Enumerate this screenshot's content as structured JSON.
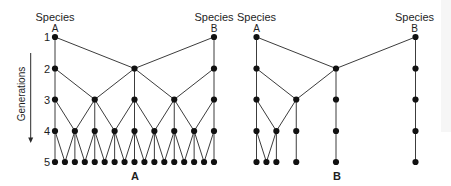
{
  "figure": {
    "generation_axis": {
      "label": "Generations",
      "ticks": [
        "1",
        "2",
        "3",
        "4",
        "5"
      ],
      "direction": "downward"
    },
    "diagrams": [
      {
        "caption": "A",
        "species": [
          {
            "name": "Species",
            "letter": "A",
            "col": 0
          },
          {
            "name": "Species",
            "letter": "B",
            "col": 16
          }
        ],
        "generations": [
          [
            0,
            16
          ],
          [
            0,
            8,
            16
          ],
          [
            0,
            4,
            8,
            12,
            16
          ],
          [
            0,
            2,
            4,
            6,
            8,
            10,
            12,
            14,
            16
          ],
          [
            0,
            1,
            2,
            3,
            4,
            5,
            6,
            7,
            8,
            9,
            10,
            11,
            12,
            13,
            14,
            15,
            16
          ]
        ],
        "edges": [
          [
            [
              0,
              0
            ],
            [
              0,
              8
            ],
            [
              16,
              8
            ],
            [
              16,
              16
            ]
          ],
          [
            [
              0,
              0
            ],
            [
              0,
              4
            ],
            [
              8,
              4
            ],
            [
              8,
              8
            ],
            [
              8,
              12
            ],
            [
              16,
              12
            ],
            [
              16,
              16
            ]
          ],
          [
            [
              0,
              0
            ],
            [
              0,
              2
            ],
            [
              4,
              2
            ],
            [
              4,
              4
            ],
            [
              4,
              6
            ],
            [
              8,
              6
            ],
            [
              8,
              8
            ],
            [
              8,
              10
            ],
            [
              12,
              10
            ],
            [
              12,
              12
            ],
            [
              12,
              14
            ],
            [
              16,
              14
            ],
            [
              16,
              16
            ]
          ],
          [
            [
              0,
              0
            ],
            [
              0,
              1
            ],
            [
              2,
              1
            ],
            [
              2,
              2
            ],
            [
              2,
              3
            ],
            [
              4,
              3
            ],
            [
              4,
              4
            ],
            [
              4,
              5
            ],
            [
              6,
              5
            ],
            [
              6,
              6
            ],
            [
              6,
              7
            ],
            [
              8,
              7
            ],
            [
              8,
              8
            ],
            [
              8,
              9
            ],
            [
              10,
              9
            ],
            [
              10,
              10
            ],
            [
              10,
              11
            ],
            [
              12,
              11
            ],
            [
              12,
              12
            ],
            [
              12,
              13
            ],
            [
              14,
              13
            ],
            [
              14,
              14
            ],
            [
              14,
              15
            ],
            [
              16,
              15
            ],
            [
              16,
              16
            ]
          ]
        ]
      },
      {
        "caption": "B",
        "species": [
          {
            "name": "Species",
            "letter": "A",
            "col": 0
          },
          {
            "name": "Species",
            "letter": "B",
            "col": 16
          }
        ],
        "generations": [
          [
            0,
            16
          ],
          [
            0,
            8,
            16
          ],
          [
            0,
            4,
            8,
            16
          ],
          [
            0,
            2,
            4,
            8,
            16
          ],
          [
            0,
            1,
            2,
            4,
            8,
            16
          ]
        ],
        "edges": [
          [
            [
              0,
              0
            ],
            [
              0,
              8
            ],
            [
              16,
              8
            ],
            [
              16,
              16
            ]
          ],
          [
            [
              0,
              0
            ],
            [
              0,
              4
            ],
            [
              8,
              4
            ],
            [
              8,
              8
            ],
            [
              16,
              16
            ]
          ],
          [
            [
              0,
              0
            ],
            [
              0,
              2
            ],
            [
              4,
              2
            ],
            [
              4,
              4
            ],
            [
              8,
              8
            ],
            [
              16,
              16
            ]
          ],
          [
            [
              0,
              0
            ],
            [
              0,
              1
            ],
            [
              2,
              1
            ],
            [
              2,
              2
            ],
            [
              4,
              4
            ],
            [
              8,
              8
            ],
            [
              16,
              16
            ]
          ]
        ]
      }
    ]
  }
}
